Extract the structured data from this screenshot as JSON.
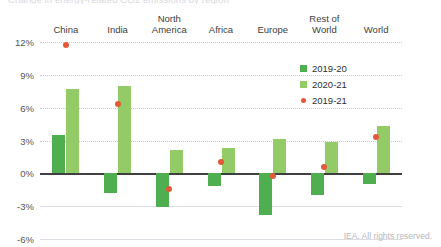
{
  "title": "Change in energy-related CO2 emissions by region",
  "footer": "IEA. All rights reserved.",
  "legend": {
    "items": [
      {
        "label": "2019-20",
        "color": "#4FAF50",
        "marker": "square"
      },
      {
        "label": "2020-21",
        "color": "#93CB67",
        "marker": "square"
      },
      {
        "label": "2019-21",
        "color": "#E2593A",
        "marker": "circle"
      }
    ]
  },
  "axis": {
    "ticks": [
      "12%",
      "9%",
      "6%",
      "3%",
      "0%",
      "-3%",
      "-6%"
    ],
    "tick_values": [
      12,
      9,
      6,
      3,
      0,
      -3,
      -6
    ]
  },
  "chart_data": {
    "type": "bar",
    "title": "Change in energy-related CO2 emissions by region",
    "xlabel": "",
    "ylabel": "",
    "ylim": [
      -6,
      12
    ],
    "grid": true,
    "legend_position": "right",
    "categories": [
      "China",
      "India",
      "North\nAmerica",
      "Africa",
      "Europe",
      "Rest of\nWorld",
      "World"
    ],
    "series": [
      {
        "name": "2019-20",
        "type": "bar",
        "color": "#4FAF50",
        "values": [
          3.5,
          -1.8,
          -3.1,
          -1.2,
          -3.8,
          -2.0,
          -1.0
        ]
      },
      {
        "name": "2020-21",
        "type": "bar",
        "color": "#93CB67",
        "values": [
          7.7,
          8.0,
          2.1,
          2.3,
          3.1,
          2.9,
          4.3
        ]
      },
      {
        "name": "2019-21",
        "type": "scatter",
        "color": "#E2593A",
        "values": [
          11.7,
          6.3,
          -1.4,
          1.0,
          -0.2,
          0.6,
          3.3
        ]
      }
    ]
  }
}
